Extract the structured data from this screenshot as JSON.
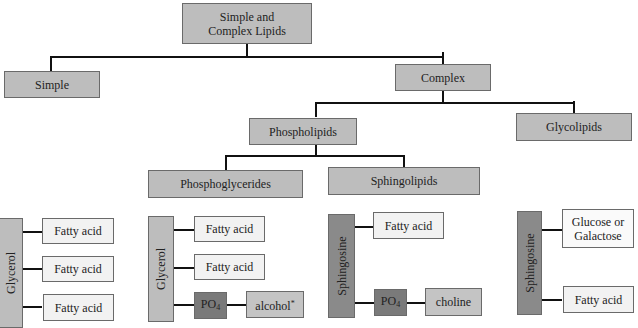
{
  "diagram": {
    "root": "Simple and Complex Lipids",
    "level1": {
      "simple": "Simple",
      "complex": "Complex"
    },
    "level2": {
      "phospholipids": "Phospholipids",
      "glycolipids": "Glycolipids"
    },
    "level3": {
      "phosphoglycerides": "Phosphoglycerides",
      "sphingolipids": "Sphingolipids"
    },
    "simple_structure": {
      "backbone": "Glycerol",
      "components": [
        "Fatty acid",
        "Fatty acid",
        "Fatty acid"
      ]
    },
    "phosphoglyceride_structure": {
      "backbone": "Glycerol",
      "components": [
        "Fatty acid",
        "Fatty acid"
      ],
      "phosphate": "PO",
      "phosphate_sub": "4",
      "alcohol": "alcohol",
      "alcohol_mark": "*"
    },
    "sphingolipid_structure": {
      "backbone": "Sphingosine",
      "fatty_acid": "Fatty acid",
      "phosphate": "PO",
      "phosphate_sub": "4",
      "choline": "choline"
    },
    "glycolipid_structure": {
      "backbone": "Sphingosine",
      "sugar_line1": "Glucose or",
      "sugar_line2": "Galactose",
      "fatty_acid": "Fatty acid"
    }
  },
  "colors": {
    "box_gray": "#bdbdbd",
    "box_light": "#f2f2f2",
    "phosphate_dark": "#7a7a7a",
    "sphingosine": "#8a8a8a",
    "connector": "#111111"
  }
}
